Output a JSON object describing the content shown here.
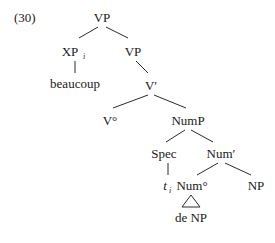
{
  "example_number": "(30)",
  "tree": {
    "root": "VP",
    "xp": "XP",
    "xp_index": "i",
    "vp": "VP",
    "beaucoup": "beaucoup",
    "vbar": "V′",
    "v0": "V°",
    "nump": "NumP",
    "spec": "Spec",
    "numbar": "Num′",
    "trace": "t",
    "trace_index": "i",
    "num0": "Num°",
    "np": "NP",
    "de_np": "de NP"
  },
  "colors": {
    "line": "#2a2a2a",
    "text": "#1a1a1a",
    "background": "#ffffff"
  }
}
